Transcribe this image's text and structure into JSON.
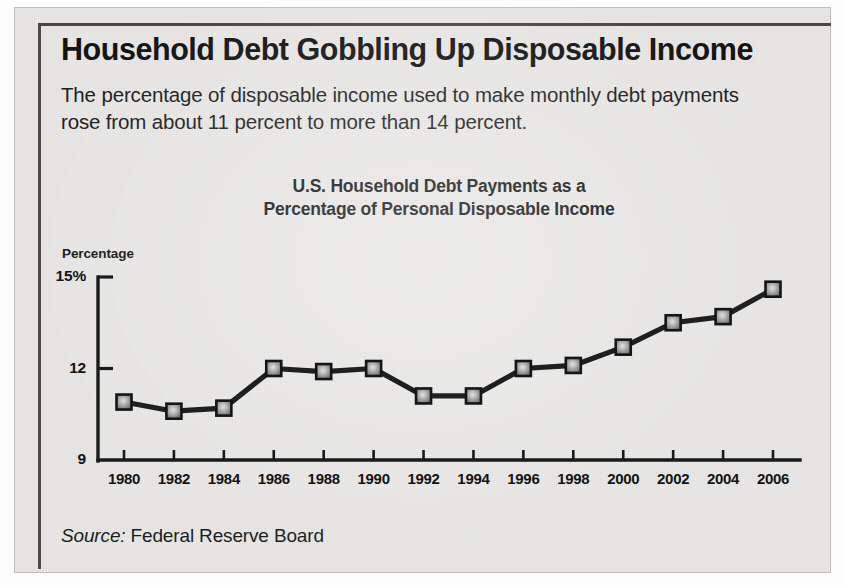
{
  "headline": "Household Debt Gobbling Up Disposable Income",
  "deck": "The percentage of disposable income used to make monthly debt payments rose from about 11 percent to more than 14 percent.",
  "source": {
    "label": "Source:",
    "value": "Federal Reserve Board"
  },
  "colors": {
    "paper": "#e9e8e6",
    "ink": "#141414",
    "axis": "#1a1a1a",
    "line": "#1f1f1f",
    "marker_edge": "#151515",
    "marker_fill": "#b9b9b9"
  },
  "chart_data": {
    "type": "line",
    "title": "U.S. Household Debt Payments as a Percentage of Personal Disposable Income",
    "title_line1": "U.S. Household Debt Payments as a",
    "title_line2": "Percentage of Personal Disposable Income",
    "xlabel": "",
    "ylabel": "Percentage",
    "ylim": [
      9,
      15
    ],
    "yticks": [
      9,
      12,
      15
    ],
    "ytick_labels": [
      "9",
      "12",
      "15%"
    ],
    "grid": false,
    "legend": null,
    "categories": [
      1980,
      1982,
      1984,
      1986,
      1988,
      1990,
      1992,
      1994,
      1996,
      1998,
      2000,
      2002,
      2004,
      2006
    ],
    "xtick_labels": [
      "1980",
      "1982",
      "1984",
      "1986",
      "1988",
      "1990",
      "1992",
      "1994",
      "1996",
      "1998",
      "2000",
      "2002",
      "2004",
      "2006"
    ],
    "values": [
      10.9,
      10.6,
      10.7,
      12.0,
      11.9,
      12.0,
      11.1,
      11.1,
      12.0,
      12.1,
      12.7,
      13.5,
      13.7,
      14.6
    ],
    "series": [
      {
        "name": "U.S. Household Debt Payments as a Percentage of Personal Disposable Income",
        "values": [
          10.9,
          10.6,
          10.7,
          12.0,
          11.9,
          12.0,
          11.1,
          11.1,
          12.0,
          12.1,
          12.7,
          13.5,
          13.7,
          14.6
        ]
      }
    ]
  }
}
